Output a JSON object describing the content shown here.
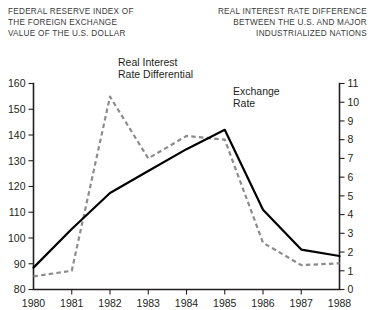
{
  "titles": {
    "left": [
      "FEDERAL RESERVE INDEX OF",
      "THE FOREIGN EXCHANGE",
      "VALUE OF THE U.S. DOLLAR"
    ],
    "right": [
      "REAL INTEREST RATE DIFFERENCE",
      "BETWEEN THE U.S. AND MAJOR",
      "INDUSTRIALIZED NATIONS"
    ]
  },
  "annotations": {
    "differential": [
      "Real Interest",
      "Rate Differential"
    ],
    "exchange": [
      "Exchange",
      "Rate"
    ]
  },
  "chart_data": {
    "type": "line",
    "xlabel": "",
    "ylabel": "FEDERAL RESERVE INDEX OF THE FOREIGN EXCHANGE VALUE OF THE U.S. DOLLAR",
    "y2label": "REAL INTEREST RATE DIFFERENCE BETWEEN THE U.S. AND MAJOR INDUSTRIALIZED NATIONS",
    "x": [
      1980,
      1981,
      1982,
      1983,
      1984,
      1985,
      1986,
      1987,
      1988
    ],
    "xticklabels": [
      "1980",
      "1981",
      "1982",
      "1983",
      "1984",
      "1985",
      "1986",
      "1987",
      "1988"
    ],
    "xlim": [
      1980,
      1988
    ],
    "ylim": [
      80,
      160
    ],
    "yticks": [
      80,
      90,
      100,
      110,
      120,
      130,
      140,
      150,
      160
    ],
    "yticklabels": [
      "80",
      "90",
      "100",
      "110",
      "120",
      "130",
      "140",
      "150",
      "160"
    ],
    "y2lim": [
      0,
      11
    ],
    "y2ticks": [
      0,
      1,
      2,
      3,
      4,
      5,
      6,
      7,
      8,
      9,
      10,
      11
    ],
    "y2ticklabels": [
      "0",
      "1",
      "2",
      "3",
      "4",
      "5",
      "6",
      "7",
      "8",
      "9",
      "10",
      "11"
    ],
    "grid": false,
    "legend": "annotated-inline",
    "series": [
      {
        "name": "Exchange Rate",
        "axis": "left",
        "style": "solid",
        "color": "#000000",
        "values": [
          88.5,
          103.5,
          117.5,
          126.0,
          134.5,
          142.0,
          111.0,
          95.5,
          93.0
        ]
      },
      {
        "name": "Real Interest Rate Differential",
        "axis": "right",
        "style": "dashed",
        "color": "#8c8c8c",
        "values": [
          0.7,
          1.0,
          10.3,
          7.0,
          8.2,
          8.0,
          2.5,
          1.3,
          1.4
        ]
      }
    ]
  }
}
